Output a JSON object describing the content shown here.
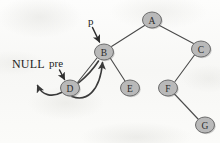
{
  "figure": {
    "width": 220,
    "height": 143,
    "background_color": "#fbfbfa",
    "node_fill_color": "#b9b9b9",
    "node_stroke_color": "#6d6d6d",
    "edge_color": "#4a4a4a",
    "text_color": "#1c1c1c"
  },
  "nodes": [
    {
      "id": "A",
      "label": "A",
      "cx": 152,
      "cy": 20,
      "rx": 9.5,
      "ry": 8
    },
    {
      "id": "B",
      "label": "B",
      "cx": 104,
      "cy": 52,
      "rx": 9.5,
      "ry": 8
    },
    {
      "id": "C",
      "label": "C",
      "cx": 201,
      "cy": 49,
      "rx": 9.5,
      "ry": 8
    },
    {
      "id": "D",
      "label": "D",
      "cx": 70,
      "cy": 88,
      "rx": 9.5,
      "ry": 8
    },
    {
      "id": "E",
      "label": "E",
      "cx": 130,
      "cy": 88,
      "rx": 9.5,
      "ry": 8
    },
    {
      "id": "F",
      "label": "F",
      "cx": 168,
      "cy": 88,
      "rx": 9.5,
      "ry": 8
    },
    {
      "id": "G",
      "label": "G",
      "cx": 205,
      "cy": 125,
      "rx": 9.5,
      "ry": 8
    }
  ],
  "edges": [
    {
      "from": "A",
      "to": "B"
    },
    {
      "from": "A",
      "to": "C"
    },
    {
      "from": "B",
      "to": "D"
    },
    {
      "from": "B",
      "to": "E"
    },
    {
      "from": "C",
      "to": "F"
    },
    {
      "from": "F",
      "to": "G"
    }
  ],
  "threads": [
    {
      "name": "d-left-thread-to-null",
      "from": "D",
      "to": "NULL"
    },
    {
      "name": "d-right-thread-to-b",
      "from": "D",
      "to": "B"
    }
  ],
  "annotations": [
    {
      "id": "null",
      "text": "NULL",
      "x": 12,
      "y": 58
    },
    {
      "id": "pre",
      "text": "pre",
      "x": 49,
      "y": 58
    },
    {
      "id": "p",
      "text": "p",
      "x": 88,
      "y": 16
    }
  ],
  "pointers": [
    {
      "name": "p-pointer",
      "label": "p",
      "targets": "B"
    },
    {
      "name": "pre-pointer",
      "label": "pre",
      "targets": "D"
    }
  ]
}
